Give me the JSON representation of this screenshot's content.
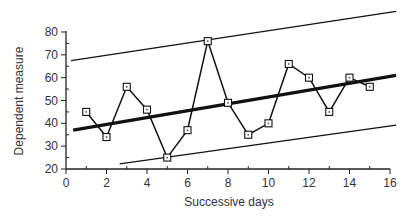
{
  "chart_data": {
    "type": "line",
    "title": "",
    "xlabel": "Successive days",
    "ylabel": "Dependent measure",
    "xlim": [
      0,
      16
    ],
    "ylim": [
      20,
      80
    ],
    "x_ticks": [
      0,
      2,
      4,
      6,
      8,
      10,
      12,
      14,
      16
    ],
    "y_ticks": [
      20,
      30,
      40,
      50,
      60,
      70,
      80
    ],
    "grid": false,
    "legend": null,
    "series": [
      {
        "name": "Observations",
        "style": "line-with-square-markers",
        "x": [
          1,
          2,
          3,
          4,
          5,
          6,
          7,
          8,
          9,
          10,
          11,
          12,
          13,
          14,
          15
        ],
        "values": [
          45,
          34,
          56,
          46,
          25,
          37,
          76,
          49,
          35,
          40,
          66,
          60,
          45,
          60,
          56
        ]
      },
      {
        "name": "Trend line",
        "style": "thick-line",
        "x": [
          0.35,
          16.3
        ],
        "values": [
          37,
          61
        ]
      },
      {
        "name": "Upper limit",
        "style": "thin-line",
        "x": [
          0.25,
          16.3
        ],
        "values": [
          67.5,
          89
        ]
      },
      {
        "name": "Lower limit",
        "style": "thin-line",
        "x": [
          2.65,
          16.3
        ],
        "values": [
          22.2,
          39.2
        ]
      }
    ]
  }
}
